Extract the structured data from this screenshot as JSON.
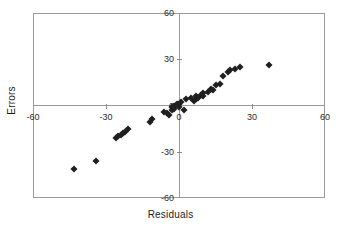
{
  "chart_data": {
    "type": "scatter",
    "title": "",
    "xlabel": "Residuals",
    "ylabel": "Errors",
    "xlim": [
      -60,
      60
    ],
    "ylim": [
      -60,
      60
    ],
    "xticks": [
      -60,
      -30,
      0,
      30,
      60
    ],
    "yticks": [
      -60,
      -30,
      0,
      30,
      60
    ],
    "xtick_labels": [
      "-60",
      "-30",
      "0",
      "30",
      "60"
    ],
    "ytick_labels": [
      "-60",
      "-30",
      "0",
      "30",
      "60"
    ],
    "grid": false,
    "legend": false,
    "marker": "diamond",
    "marker_color": "#1f1f1f",
    "axis_color": "#9a9a9a",
    "series": [
      {
        "name": "residuals-vs-errors",
        "points": [
          [
            -43,
            -41
          ],
          [
            -34,
            -36
          ],
          [
            -26,
            -21
          ],
          [
            -25,
            -20
          ],
          [
            -24,
            -19
          ],
          [
            -23,
            -18
          ],
          [
            -22,
            -17
          ],
          [
            -21,
            -15
          ],
          [
            -12,
            -11
          ],
          [
            -11,
            -9
          ],
          [
            -6,
            -4
          ],
          [
            -5,
            -5
          ],
          [
            -4,
            -6
          ],
          [
            -3,
            -3
          ],
          [
            -3,
            -1
          ],
          [
            -2,
            -2
          ],
          [
            -2,
            0
          ],
          [
            -1,
            1
          ],
          [
            0,
            -1
          ],
          [
            0,
            1
          ],
          [
            1,
            2
          ],
          [
            2,
            -3
          ],
          [
            3,
            4
          ],
          [
            5,
            5
          ],
          [
            6,
            3
          ],
          [
            7,
            4
          ],
          [
            7,
            6
          ],
          [
            8,
            5
          ],
          [
            9,
            7
          ],
          [
            10,
            6
          ],
          [
            10,
            8
          ],
          [
            12,
            9
          ],
          [
            13,
            11
          ],
          [
            14,
            10
          ],
          [
            15,
            13
          ],
          [
            17,
            14
          ],
          [
            18,
            19
          ],
          [
            20,
            22
          ],
          [
            21,
            23
          ],
          [
            23,
            24
          ],
          [
            25,
            25
          ],
          [
            37,
            26
          ]
        ]
      }
    ]
  },
  "axes": {
    "x_title": "Residuals",
    "y_title": "Errors"
  }
}
